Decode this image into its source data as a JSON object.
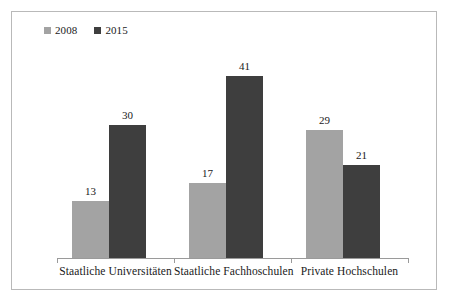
{
  "chart_data": {
    "type": "bar",
    "title": "",
    "subtitle": "",
    "xlabel": "",
    "ylabel": "",
    "categories": [
      "Staatliche Universitäten",
      "Staatliche Fachhoschulen",
      "Private Hochschulen"
    ],
    "series": [
      {
        "name": "2008",
        "color": "#a3a3a3",
        "values": [
          13,
          17,
          29
        ]
      },
      {
        "name": "2015",
        "color": "#3e3e3e",
        "values": [
          30,
          41,
          21
        ]
      }
    ],
    "ylim": [
      0,
      45
    ],
    "grid": false,
    "legend_position": "top-left",
    "data_labels": true,
    "axis_line_color": "#9a9a9a",
    "frame_color": "#b9b9b9",
    "background": "#ffffff"
  },
  "legend": {
    "entries": [
      {
        "label": "2008",
        "color": "#a3a3a3"
      },
      {
        "label": "2015",
        "color": "#3e3e3e"
      }
    ]
  },
  "labels": {
    "g0_s0": "13",
    "g0_s1": "30",
    "g1_s0": "17",
    "g1_s1": "41",
    "g2_s0": "29",
    "g2_s1": "21",
    "cat0": "Staatliche Universitäten",
    "cat1": "Staatliche Fachhoschulen",
    "cat2": "Private Hochschulen"
  }
}
